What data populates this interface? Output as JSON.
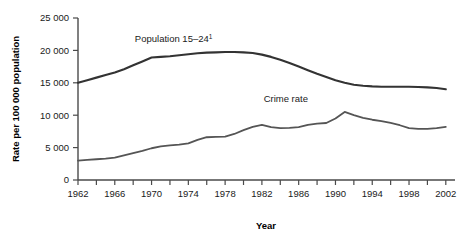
{
  "chart_data": {
    "type": "line",
    "title": "",
    "xlabel": "Year",
    "ylabel": "Rate per 100 000 population",
    "xlim": [
      1962,
      2003
    ],
    "ylim": [
      0,
      25000
    ],
    "grid": false,
    "legend_position": "inline-annotation",
    "y_ticks": [
      "0",
      "5 000",
      "10 000",
      "15 000",
      "20 000",
      "25 000"
    ],
    "y_tick_values": [
      0,
      5000,
      10000,
      15000,
      20000,
      25000
    ],
    "x_ticks": [
      "1962",
      "1966",
      "1970",
      "1974",
      "1978",
      "1982",
      "1986",
      "1990",
      "1994",
      "1998",
      "2002"
    ],
    "x_tick_values": [
      1962,
      1966,
      1970,
      1974,
      1978,
      1982,
      1986,
      1990,
      1994,
      1998,
      2002
    ],
    "x_minor_tick_values": [
      1964,
      1968,
      1972,
      1976,
      1980,
      1984,
      1988,
      1992,
      1996,
      2000
    ],
    "x": [
      1962,
      1963,
      1964,
      1965,
      1966,
      1967,
      1968,
      1969,
      1970,
      1971,
      1972,
      1973,
      1974,
      1975,
      1976,
      1977,
      1978,
      1979,
      1980,
      1981,
      1982,
      1983,
      1984,
      1985,
      1986,
      1987,
      1988,
      1989,
      1990,
      1991,
      1992,
      1993,
      1994,
      1995,
      1996,
      1997,
      1998,
      1999,
      2000,
      2001,
      2002
    ],
    "series": [
      {
        "name": "Population 15–24¹",
        "label": "Population 15–24",
        "label_superscript": "1",
        "color": "#333333",
        "label_x": 1972.4,
        "label_y": 21300,
        "values": [
          15000,
          15400,
          15800,
          16200,
          16600,
          17100,
          17700,
          18300,
          18900,
          19000,
          19100,
          19250,
          19400,
          19550,
          19650,
          19700,
          19750,
          19750,
          19700,
          19600,
          19350,
          19000,
          18550,
          18050,
          17500,
          16950,
          16400,
          15900,
          15400,
          15000,
          14700,
          14550,
          14450,
          14400,
          14400,
          14400,
          14400,
          14350,
          14300,
          14200,
          14000
        ]
      },
      {
        "name": "Crime rate",
        "label": "Crime rate",
        "color": "#555555",
        "label_x": 1984.6,
        "label_y": 12100,
        "values": [
          3000,
          3100,
          3200,
          3300,
          3450,
          3800,
          4150,
          4500,
          4900,
          5200,
          5350,
          5450,
          5650,
          6200,
          6600,
          6650,
          6700,
          7100,
          7700,
          8200,
          8500,
          8150,
          8000,
          8050,
          8150,
          8500,
          8700,
          8800,
          9500,
          10500,
          10000,
          9600,
          9300,
          9100,
          8800,
          8450,
          8000,
          7900,
          7900,
          8000,
          8200
        ]
      }
    ]
  }
}
